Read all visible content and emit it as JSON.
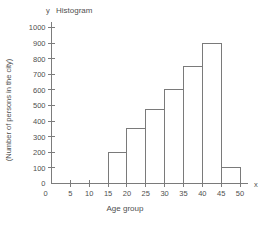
{
  "chart_data": {
    "type": "bar",
    "title": "Histogram",
    "xlabel": "Age group",
    "ylabel": "(Number of persons in the city)",
    "x_axis_letter": "x",
    "y_axis_letter": "y",
    "categories": [
      "0-5",
      "5-10",
      "10-15",
      "15-20",
      "20-25",
      "25-30",
      "30-35",
      "35-40",
      "40-45",
      "45-50"
    ],
    "bin_edges": [
      0,
      5,
      10,
      15,
      20,
      25,
      30,
      35,
      40,
      45,
      50
    ],
    "values": [
      0,
      0,
      0,
      200,
      350,
      475,
      600,
      750,
      900,
      100
    ],
    "xlim": [
      0,
      50
    ],
    "ylim": [
      0,
      1000
    ],
    "x_ticks": [
      0,
      5,
      10,
      15,
      20,
      25,
      30,
      35,
      40,
      45,
      50
    ],
    "y_ticks": [
      0,
      100,
      200,
      300,
      400,
      500,
      600,
      700,
      800,
      900,
      1000
    ],
    "x_tick_labels": [
      "0",
      "5",
      "10",
      "15",
      "20",
      "25",
      "30",
      "35",
      "40",
      "45",
      "50"
    ],
    "y_tick_labels": [
      "0",
      "100",
      "200",
      "300",
      "400",
      "500",
      "600",
      "700",
      "800",
      "900",
      "1000"
    ],
    "grid": false,
    "legend": null,
    "bar_fill": "none",
    "bar_stroke": "#7a7a7a",
    "axis_color": "#7c7c7c"
  }
}
